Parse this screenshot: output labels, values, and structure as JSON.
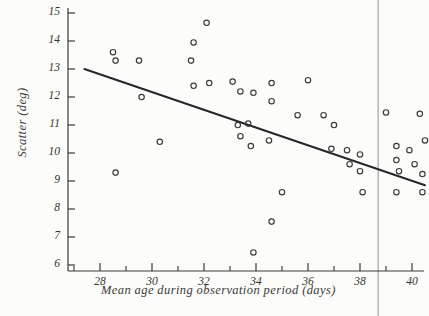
{
  "chart_data": {
    "type": "scatter",
    "title": "",
    "xlabel": "Mean age during observation period (days)",
    "ylabel": "Scatter (deg)",
    "xlim": [
      26.9,
      41.3
    ],
    "ylim": [
      5.3,
      15.3
    ],
    "grid": false,
    "legend": "none",
    "x_ticks_major": [
      28,
      30,
      32,
      34,
      36,
      38,
      40
    ],
    "x_ticks_minor": [
      27,
      29,
      31,
      33,
      35,
      37,
      39,
      41
    ],
    "y_ticks_major": [
      6,
      7,
      8,
      9,
      10,
      11,
      12,
      13,
      14,
      15
    ],
    "marker": "open-circle",
    "marker_color": "#3a3a38",
    "points": [
      {
        "x": 28.5,
        "y": 13.6
      },
      {
        "x": 28.6,
        "y": 13.3
      },
      {
        "x": 28.6,
        "y": 9.3
      },
      {
        "x": 29.5,
        "y": 13.3
      },
      {
        "x": 29.6,
        "y": 12.0
      },
      {
        "x": 30.3,
        "y": 10.4
      },
      {
        "x": 31.5,
        "y": 13.3
      },
      {
        "x": 31.6,
        "y": 13.95
      },
      {
        "x": 32.1,
        "y": 14.65
      },
      {
        "x": 31.6,
        "y": 12.4
      },
      {
        "x": 32.2,
        "y": 12.5
      },
      {
        "x": 33.1,
        "y": 12.55
      },
      {
        "x": 33.4,
        "y": 12.2
      },
      {
        "x": 33.9,
        "y": 12.15
      },
      {
        "x": 34.6,
        "y": 12.5
      },
      {
        "x": 33.3,
        "y": 11.0
      },
      {
        "x": 33.7,
        "y": 11.05
      },
      {
        "x": 33.4,
        "y": 10.6
      },
      {
        "x": 33.8,
        "y": 10.25
      },
      {
        "x": 34.6,
        "y": 11.85
      },
      {
        "x": 34.5,
        "y": 10.45
      },
      {
        "x": 35.0,
        "y": 8.6
      },
      {
        "x": 34.6,
        "y": 7.55
      },
      {
        "x": 33.9,
        "y": 6.45
      },
      {
        "x": 36.0,
        "y": 12.6
      },
      {
        "x": 35.6,
        "y": 11.35
      },
      {
        "x": 36.6,
        "y": 11.35
      },
      {
        "x": 37.0,
        "y": 11.0
      },
      {
        "x": 36.9,
        "y": 10.15
      },
      {
        "x": 37.5,
        "y": 10.1
      },
      {
        "x": 37.6,
        "y": 9.6
      },
      {
        "x": 38.0,
        "y": 9.95
      },
      {
        "x": 38.0,
        "y": 9.35
      },
      {
        "x": 38.1,
        "y": 8.6
      },
      {
        "x": 39.0,
        "y": 11.45
      },
      {
        "x": 39.4,
        "y": 10.25
      },
      {
        "x": 39.4,
        "y": 9.75
      },
      {
        "x": 39.5,
        "y": 9.35
      },
      {
        "x": 39.4,
        "y": 8.6
      },
      {
        "x": 39.9,
        "y": 10.1
      },
      {
        "x": 40.3,
        "y": 11.4
      },
      {
        "x": 40.1,
        "y": 9.6
      },
      {
        "x": 40.5,
        "y": 10.45
      },
      {
        "x": 40.4,
        "y": 9.25
      },
      {
        "x": 40.4,
        "y": 8.6
      }
    ],
    "trend_line": {
      "label": "regression-line",
      "x_start": 27.4,
      "y_start": 13.0,
      "x_end": 40.5,
      "y_end": 8.85
    },
    "reference_line": {
      "label": "vertical-reference-line",
      "x": 38.7,
      "color": "#b9b9b7"
    }
  }
}
